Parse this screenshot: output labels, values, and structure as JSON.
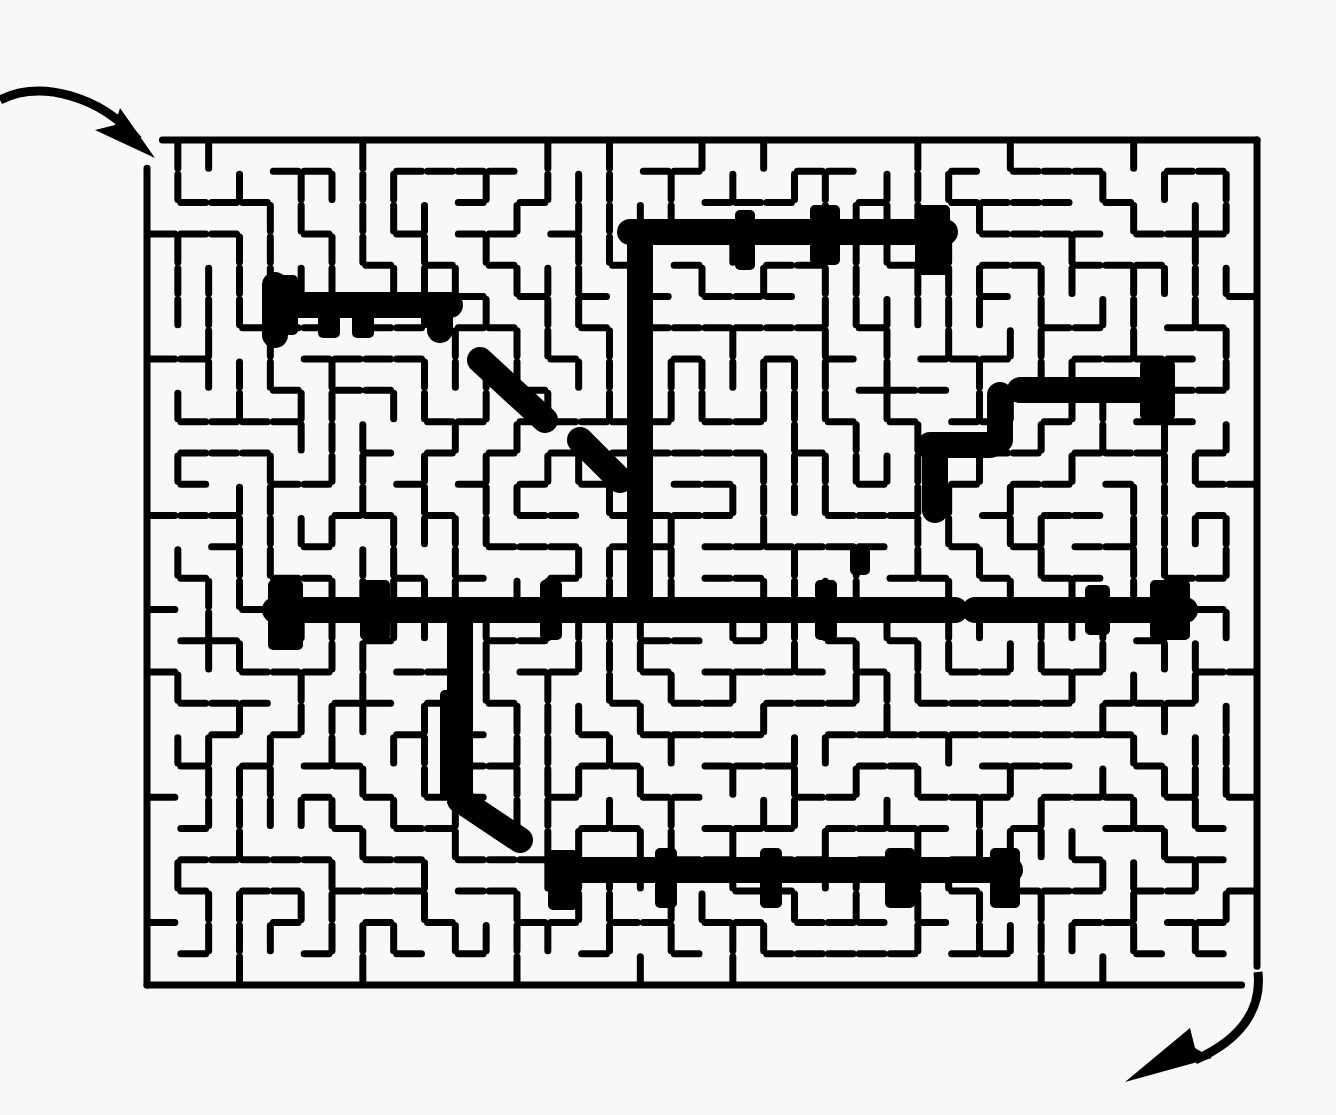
{
  "puzzle": {
    "type": "maze",
    "entrance": {
      "position": "top-left",
      "arrow": "curved-arrow-in"
    },
    "exit": {
      "position": "bottom-right",
      "arrow": "curved-arrow-out"
    },
    "colors": {
      "background": "#f8f8f8",
      "ink": "#000000"
    },
    "border": {
      "x": 147,
      "y": 140,
      "width": 1110,
      "height": 845
    },
    "grid": {
      "cols": 36,
      "rows": 27,
      "cell": 30.8
    },
    "seed": 7331,
    "thick_segments": [
      [
        630,
        232,
        945,
        232
      ],
      [
        640,
        232,
        640,
        610
      ],
      [
        275,
        610,
        955,
        610
      ],
      [
        460,
        610,
        460,
        800
      ],
      [
        460,
        800,
        520,
        840
      ],
      [
        560,
        870,
        1010,
        870
      ],
      [
        975,
        610,
        1185,
        610
      ],
      [
        1020,
        390,
        1160,
        390
      ],
      [
        1160,
        370,
        1160,
        410
      ],
      [
        275,
        305,
        450,
        305
      ],
      [
        275,
        285,
        275,
        335
      ],
      [
        440,
        305,
        440,
        330
      ],
      [
        480,
        360,
        545,
        420
      ],
      [
        580,
        440,
        620,
        480
      ],
      [
        930,
        445,
        990,
        445
      ],
      [
        935,
        445,
        935,
        510
      ],
      [
        1000,
        395,
        1000,
        440
      ]
    ],
    "thick_blocks": [
      [
        268,
        275,
        30,
        60
      ],
      [
        318,
        300,
        22,
        38
      ],
      [
        352,
        300,
        22,
        38
      ],
      [
        735,
        210,
        20,
        60
      ],
      [
        810,
        205,
        30,
        60
      ],
      [
        915,
        205,
        35,
        70
      ],
      [
        268,
        580,
        35,
        70
      ],
      [
        360,
        580,
        30,
        60
      ],
      [
        540,
        580,
        22,
        60
      ],
      [
        815,
        580,
        22,
        60
      ],
      [
        1150,
        580,
        40,
        60
      ],
      [
        1085,
        585,
        25,
        50
      ],
      [
        440,
        690,
        22,
        110
      ],
      [
        990,
        848,
        30,
        60
      ],
      [
        885,
        848,
        30,
        60
      ],
      [
        760,
        848,
        22,
        60
      ],
      [
        655,
        848,
        22,
        60
      ],
      [
        548,
        850,
        30,
        60
      ],
      [
        1140,
        360,
        35,
        60
      ],
      [
        850,
        545,
        20,
        30
      ]
    ]
  }
}
